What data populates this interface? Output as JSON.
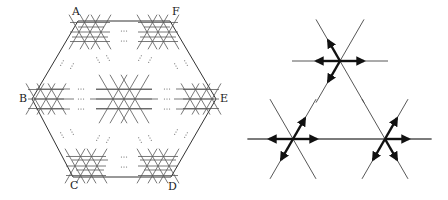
{
  "left_diagram": {
    "title": "hexagonal lattice with corner and center stars",
    "vertex_labels": {
      "A": "A",
      "B": "B",
      "C": "C",
      "D": "D",
      "E": "E",
      "F": "F"
    },
    "ellipsis": "···"
  },
  "right_diagram": {
    "title": "three six-line stars with arrows",
    "stars": [
      {
        "name": "top",
        "cx": 340,
        "cy": 61
      },
      {
        "name": "bottom-left",
        "cx": 293,
        "cy": 139
      },
      {
        "name": "bottom-right",
        "cx": 385,
        "cy": 139
      }
    ]
  }
}
